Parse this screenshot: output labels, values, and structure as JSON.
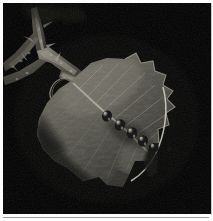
{
  "image": {
    "title": "Insects on a serrated leaf attached to a thorny branch",
    "caption": "Dark flash-lit macro nature photograph",
    "subject": "row of small dark beetles feeding along a leaf surface",
    "orientation": "portrait",
    "width_px": 213,
    "height_px": 221,
    "lighting": "direct flash against black night background",
    "palette": {
      "background": "#000000",
      "deep_shadow": "#050505",
      "leaf_dark": "#2a2a26",
      "leaf_mid": "#5e5c52",
      "leaf_light": "#9c9a8c",
      "leaf_highlight": "#cfccbc",
      "vein_highlight": "#e6e3d4",
      "branch_mid": "#6b675c",
      "branch_light": "#b5b1a2",
      "insect_body": "#0b0b0c",
      "insect_gloss": "#d8d5c8",
      "mat_white": "#fdfdfd",
      "rule_gray": "#9a9a9a"
    }
  },
  "frame": {
    "mat_label": "white photo mat border",
    "bottom_rule_label": "bottom hairline rule",
    "right_rule_label": "right hairline rule"
  },
  "scene": {
    "elements": [
      {
        "name": "night-background",
        "label": "Black night background",
        "region": "full frame"
      },
      {
        "name": "branch",
        "label": "Forked thorny branch",
        "region": "upper left, running diagonally down-right"
      },
      {
        "name": "branch-fork",
        "label": "Branch fork junction",
        "region": "upper left at about 28% width, 30% height"
      },
      {
        "name": "branch-thorns",
        "label": "Small thorns and bark texture along branch",
        "region": "upper left"
      },
      {
        "name": "petiole",
        "label": "Leaf stalk joining leaf to branch",
        "region": "left of leaf base"
      },
      {
        "name": "tendril-loop",
        "label": "Curved tendril loop near leaf base",
        "region": "left center"
      },
      {
        "name": "leaf",
        "label": "Large serrated leaf, lit by flash",
        "region": "center to lower right"
      },
      {
        "name": "leaf-midrib",
        "label": "Bright midrib running to leaf tip",
        "region": "diagonal through leaf"
      },
      {
        "name": "leaf-veins",
        "label": "Lateral veins branching from midrib",
        "region": "across leaf blade"
      },
      {
        "name": "leaf-serrations",
        "label": "Toothed margin along upper right edge",
        "region": "right edge of leaf"
      },
      {
        "name": "leaf-tip",
        "label": "Pointed leaf tip",
        "region": "lower right"
      },
      {
        "name": "insect-cluster",
        "label": "Row of five small dark insects",
        "region": "center of leaf"
      }
    ],
    "insects": [
      {
        "name": "insect-1",
        "label": "Beetle 1",
        "x_pct": 50.0,
        "y_pct": 53.5,
        "size_px": 9
      },
      {
        "name": "insect-2",
        "label": "Beetle 2",
        "x_pct": 56.5,
        "y_pct": 58.0,
        "size_px": 9
      },
      {
        "name": "insect-3",
        "label": "Beetle 3",
        "x_pct": 62.0,
        "y_pct": 61.5,
        "size_px": 9
      },
      {
        "name": "insect-4",
        "label": "Beetle 4",
        "x_pct": 67.5,
        "y_pct": 65.5,
        "size_px": 9
      },
      {
        "name": "insect-5",
        "label": "Beetle 5",
        "x_pct": 73.0,
        "y_pct": 68.5,
        "size_px": 8
      }
    ]
  }
}
